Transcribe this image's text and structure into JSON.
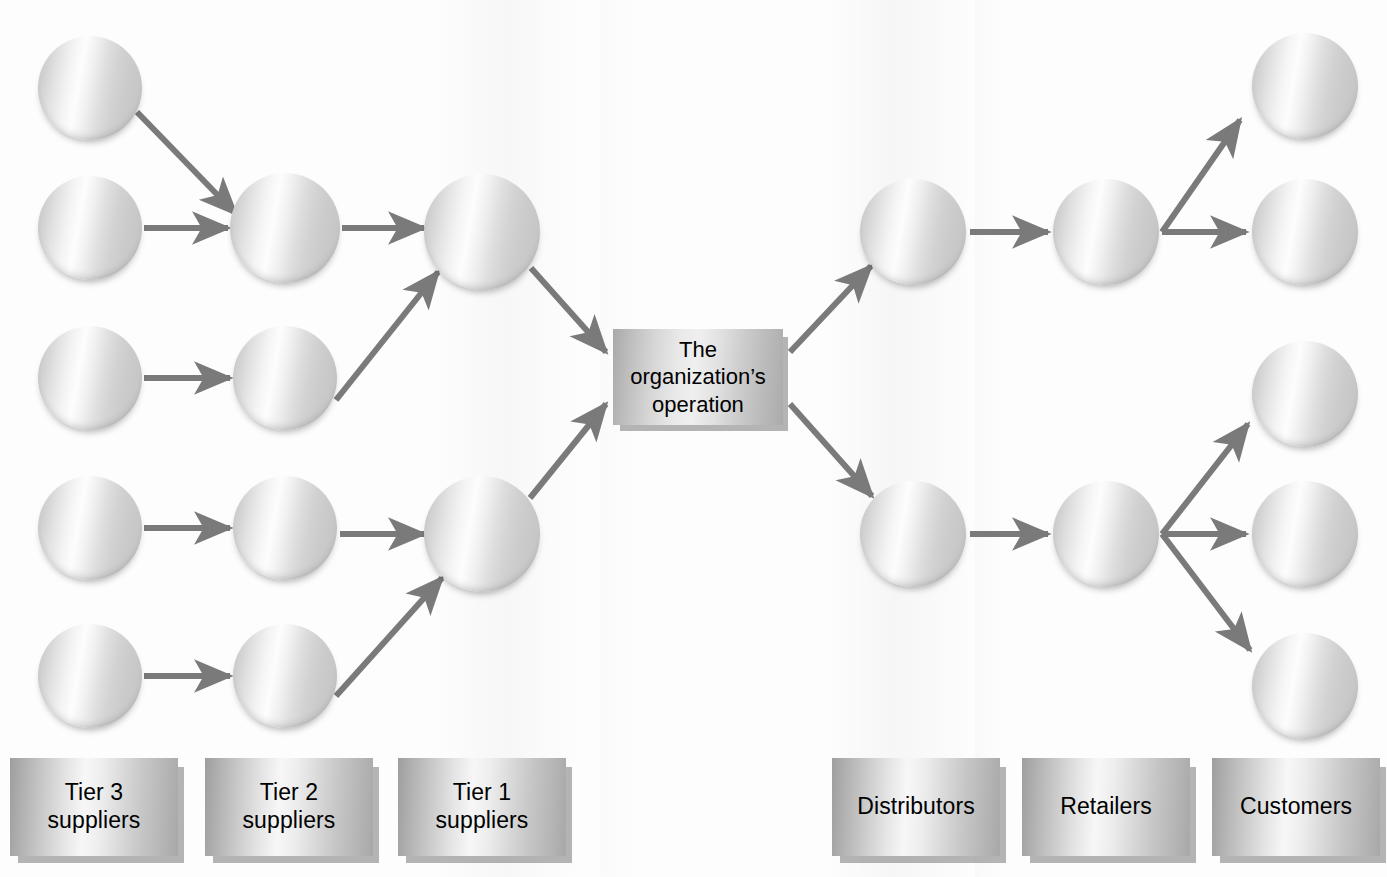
{
  "diagram": {
    "type": "supply-chain-network",
    "center": {
      "label": "The\norganization’s\noperation",
      "line1": "The",
      "line2": "organization’s",
      "line3": "operation",
      "x": 613,
      "y": 329,
      "w": 170,
      "h": 96
    },
    "colors": {
      "arrow": "#7a7a7a",
      "plate_text": "#000000",
      "page_background": "#fdfdfd",
      "node_light": "#fdfdfd",
      "node_dark": "#c0c0c0"
    },
    "tiers": [
      {
        "id": "tier3-suppliers",
        "label_line1": "Tier 3",
        "label_line2": "suppliers",
        "label": "Tier 3 suppliers",
        "side": "supply",
        "plate": {
          "x": 10,
          "y": 758,
          "w": 168,
          "h": 98
        },
        "node_count": 5
      },
      {
        "id": "tier2-suppliers",
        "label_line1": "Tier 2",
        "label_line2": "suppliers",
        "label": "Tier 2 suppliers",
        "side": "supply",
        "plate": {
          "x": 205,
          "y": 758,
          "w": 168,
          "h": 98
        },
        "node_count": 4
      },
      {
        "id": "tier1-suppliers",
        "label_line1": "Tier 1",
        "label_line2": "suppliers",
        "label": "Tier 1 suppliers",
        "side": "supply",
        "plate": {
          "x": 398,
          "y": 758,
          "w": 168,
          "h": 98
        },
        "node_count": 2
      },
      {
        "id": "distributors",
        "label_line1": "Distributors",
        "label_line2": "",
        "label": "Distributors",
        "side": "demand",
        "plate": {
          "x": 832,
          "y": 758,
          "w": 168,
          "h": 98
        },
        "node_count": 2
      },
      {
        "id": "retailers",
        "label_line1": "Retailers",
        "label_line2": "",
        "label": "Retailers",
        "side": "demand",
        "plate": {
          "x": 1022,
          "y": 758,
          "w": 168,
          "h": 98
        },
        "node_count": 2
      },
      {
        "id": "customers",
        "label_line1": "Customers",
        "label_line2": "",
        "label": "Customers",
        "side": "demand",
        "plate": {
          "x": 1212,
          "y": 758,
          "w": 168,
          "h": 98
        },
        "node_count": 5
      }
    ],
    "nodes": [
      {
        "id": "t3-1",
        "tier": "tier3-suppliers",
        "cx": 90,
        "cy": 88,
        "r": 52
      },
      {
        "id": "t3-2",
        "tier": "tier3-suppliers",
        "cx": 90,
        "cy": 228,
        "r": 52
      },
      {
        "id": "t3-3",
        "tier": "tier3-suppliers",
        "cx": 90,
        "cy": 378,
        "r": 52
      },
      {
        "id": "t3-4",
        "tier": "tier3-suppliers",
        "cx": 90,
        "cy": 528,
        "r": 52
      },
      {
        "id": "t3-5",
        "tier": "tier3-suppliers",
        "cx": 90,
        "cy": 676,
        "r": 52
      },
      {
        "id": "t2-1",
        "tier": "tier2-suppliers",
        "cx": 285,
        "cy": 228,
        "r": 55
      },
      {
        "id": "t2-2",
        "tier": "tier2-suppliers",
        "cx": 285,
        "cy": 378,
        "r": 52
      },
      {
        "id": "t2-3",
        "tier": "tier2-suppliers",
        "cx": 285,
        "cy": 528,
        "r": 52
      },
      {
        "id": "t2-4",
        "tier": "tier2-suppliers",
        "cx": 285,
        "cy": 676,
        "r": 52
      },
      {
        "id": "t1-1",
        "tier": "tier1-suppliers",
        "cx": 482,
        "cy": 232,
        "r": 58
      },
      {
        "id": "t1-2",
        "tier": "tier1-suppliers",
        "cx": 482,
        "cy": 534,
        "r": 58
      },
      {
        "id": "ds-1",
        "tier": "distributors",
        "cx": 913,
        "cy": 232,
        "r": 53
      },
      {
        "id": "ds-2",
        "tier": "distributors",
        "cx": 913,
        "cy": 534,
        "r": 53
      },
      {
        "id": "rt-1",
        "tier": "retailers",
        "cx": 1106,
        "cy": 232,
        "r": 53
      },
      {
        "id": "rt-2",
        "tier": "retailers",
        "cx": 1106,
        "cy": 534,
        "r": 53
      },
      {
        "id": "cu-1",
        "tier": "customers",
        "cx": 1305,
        "cy": 86,
        "r": 53
      },
      {
        "id": "cu-2",
        "tier": "customers",
        "cx": 1305,
        "cy": 232,
        "r": 53
      },
      {
        "id": "cu-3",
        "tier": "customers",
        "cx": 1305,
        "cy": 394,
        "r": 53
      },
      {
        "id": "cu-4",
        "tier": "customers",
        "cx": 1305,
        "cy": 534,
        "r": 53
      },
      {
        "id": "cu-5",
        "tier": "customers",
        "cx": 1305,
        "cy": 686,
        "r": 53
      }
    ],
    "edges": [
      {
        "id": "e1",
        "from": "t3-1",
        "to": "t2-1",
        "x1": 137,
        "y1": 112,
        "x2": 236,
        "y2": 214
      },
      {
        "id": "e2",
        "from": "t3-2",
        "to": "t2-1",
        "x1": 144,
        "y1": 228,
        "x2": 228,
        "y2": 228
      },
      {
        "id": "e3",
        "from": "t3-3",
        "to": "t2-2",
        "x1": 144,
        "y1": 378,
        "x2": 230,
        "y2": 378
      },
      {
        "id": "e4",
        "from": "t3-4",
        "to": "t2-3",
        "x1": 144,
        "y1": 528,
        "x2": 230,
        "y2": 528
      },
      {
        "id": "e5",
        "from": "t3-5",
        "to": "t2-4",
        "x1": 144,
        "y1": 676,
        "x2": 230,
        "y2": 676
      },
      {
        "id": "e6",
        "from": "t2-1",
        "to": "t1-1",
        "x1": 342,
        "y1": 228,
        "x2": 424,
        "y2": 228
      },
      {
        "id": "e7",
        "from": "t2-2",
        "to": "t1-1",
        "x1": 336,
        "y1": 400,
        "x2": 438,
        "y2": 272
      },
      {
        "id": "e8",
        "from": "t2-3",
        "to": "t1-2",
        "x1": 340,
        "y1": 534,
        "x2": 424,
        "y2": 534
      },
      {
        "id": "e9",
        "from": "t2-4",
        "to": "t1-2",
        "x1": 336,
        "y1": 696,
        "x2": 442,
        "y2": 578
      },
      {
        "id": "e10",
        "from": "t1-1",
        "to": "center",
        "x1": 531,
        "y1": 268,
        "x2": 606,
        "y2": 352
      },
      {
        "id": "e11",
        "from": "t1-2",
        "to": "center",
        "x1": 530,
        "y1": 498,
        "x2": 606,
        "y2": 404
      },
      {
        "id": "e12",
        "from": "center",
        "to": "ds-1",
        "x1": 790,
        "y1": 352,
        "x2": 871,
        "y2": 266
      },
      {
        "id": "e13",
        "from": "center",
        "to": "ds-2",
        "x1": 790,
        "y1": 404,
        "x2": 872,
        "y2": 496
      },
      {
        "id": "e14",
        "from": "ds-1",
        "to": "rt-1",
        "x1": 970,
        "y1": 232,
        "x2": 1048,
        "y2": 232
      },
      {
        "id": "e15",
        "from": "ds-2",
        "to": "rt-2",
        "x1": 970,
        "y1": 534,
        "x2": 1048,
        "y2": 534
      },
      {
        "id": "e16",
        "from": "rt-1",
        "to": "cu-1",
        "x1": 1162,
        "y1": 232,
        "x2": 1240,
        "y2": 120
      },
      {
        "id": "e17",
        "from": "rt-1",
        "to": "cu-2",
        "x1": 1162,
        "y1": 232,
        "x2": 1246,
        "y2": 232
      },
      {
        "id": "e18",
        "from": "rt-2",
        "to": "cu-3",
        "x1": 1162,
        "y1": 534,
        "x2": 1248,
        "y2": 424
      },
      {
        "id": "e19",
        "from": "rt-2",
        "to": "cu-4",
        "x1": 1162,
        "y1": 534,
        "x2": 1246,
        "y2": 534
      },
      {
        "id": "e20",
        "from": "rt-2",
        "to": "cu-5",
        "x1": 1162,
        "y1": 534,
        "x2": 1250,
        "y2": 650
      }
    ]
  }
}
